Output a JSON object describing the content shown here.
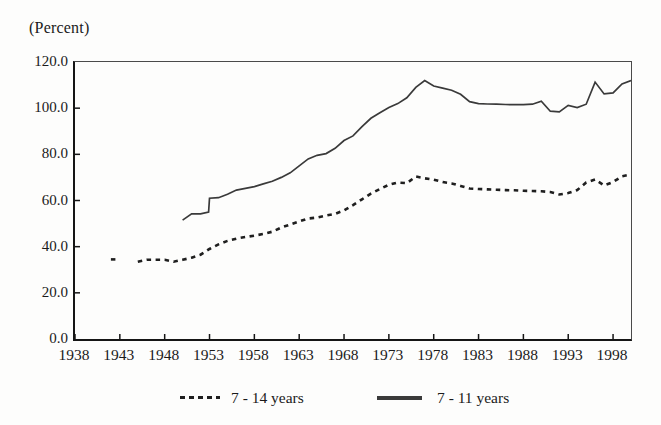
{
  "page": {
    "background": "#fdfdfc",
    "text_color": "#1a1a1a",
    "axis_color": "#151515"
  },
  "unit_label": "(Percent)",
  "chart_data": {
    "type": "line",
    "title": "",
    "xlabel": "",
    "ylabel": "(Percent)",
    "xlim": [
      1938,
      2000
    ],
    "ylim": [
      0,
      120
    ],
    "grid": false,
    "legend_position": "bottom-center",
    "x_ticks": [
      1938,
      1943,
      1948,
      1953,
      1958,
      1963,
      1968,
      1973,
      1978,
      1983,
      1988,
      1993,
      1998
    ],
    "y_ticks": [
      0,
      20,
      40,
      60,
      80,
      100,
      120
    ],
    "y_tick_labels": [
      "0.0",
      "20.0",
      "40.0",
      "60.0",
      "80.0",
      "100.0",
      "120.0"
    ],
    "series": [
      {
        "name": "7 - 14 years",
        "style": "dashed",
        "color": "#1f1f1f",
        "stroke_width": 2.6,
        "dash_pattern": "4.5 4.5",
        "segments": [
          [
            [
              1942,
              34.5
            ],
            [
              1942.7,
              34.5
            ]
          ],
          [
            [
              1945,
              33.5
            ],
            [
              1946,
              34.3
            ],
            [
              1947,
              34.3
            ],
            [
              1948,
              34.3
            ],
            [
              1949,
              33.5
            ],
            [
              1950,
              34.3
            ],
            [
              1951,
              35.2
            ],
            [
              1952,
              36.5
            ],
            [
              1953,
              39.0
            ],
            [
              1954,
              41.0
            ],
            [
              1955,
              42.5
            ],
            [
              1956,
              43.5
            ],
            [
              1957,
              44.2
            ],
            [
              1958,
              44.8
            ],
            [
              1959,
              45.5
            ],
            [
              1960,
              46.5
            ],
            [
              1961,
              48.3
            ],
            [
              1962,
              49.6
            ],
            [
              1963,
              51.0
            ],
            [
              1964,
              52.2
            ],
            [
              1965,
              52.6
            ],
            [
              1966,
              53.5
            ],
            [
              1967,
              54.2
            ],
            [
              1968,
              55.7
            ],
            [
              1969,
              58.0
            ],
            [
              1970,
              60.5
            ],
            [
              1971,
              63.0
            ],
            [
              1972,
              65.0
            ],
            [
              1973,
              66.8
            ],
            [
              1974,
              67.8
            ],
            [
              1975,
              67.5
            ],
            [
              1976,
              70.4
            ],
            [
              1977,
              69.6
            ],
            [
              1978,
              69.0
            ],
            [
              1979,
              68.0
            ],
            [
              1980,
              67.4
            ],
            [
              1981,
              66.3
            ],
            [
              1982,
              65.2
            ],
            [
              1983,
              65.0
            ],
            [
              1984,
              64.8
            ],
            [
              1985,
              64.7
            ],
            [
              1986,
              64.5
            ],
            [
              1987,
              64.4
            ],
            [
              1988,
              64.2
            ],
            [
              1989,
              64.1
            ],
            [
              1990,
              64.0
            ],
            [
              1991,
              63.7
            ],
            [
              1992,
              62.6
            ],
            [
              1993,
              63.2
            ],
            [
              1994,
              64.5
            ],
            [
              1995,
              67.8
            ],
            [
              1996,
              69.1
            ],
            [
              1997,
              66.5
            ],
            [
              1998,
              68.0
            ],
            [
              1999,
              70.5
            ],
            [
              2000,
              71.3
            ]
          ]
        ]
      },
      {
        "name": "7 - 11 years",
        "style": "solid",
        "color": "#3a3a3a",
        "stroke_width": 1.7,
        "dash_pattern": "",
        "segments": [
          [
            [
              1950,
              51.5
            ],
            [
              1951,
              54.2
            ],
            [
              1952,
              54.2
            ],
            [
              1952.9,
              55.0
            ],
            [
              1953,
              61.0
            ],
            [
              1954,
              61.2
            ],
            [
              1955,
              62.7
            ],
            [
              1956,
              64.5
            ],
            [
              1957,
              65.3
            ],
            [
              1958,
              66.0
            ],
            [
              1959,
              67.2
            ],
            [
              1960,
              68.3
            ],
            [
              1961,
              70.0
            ],
            [
              1962,
              72.0
            ],
            [
              1963,
              75.0
            ],
            [
              1964,
              78.0
            ],
            [
              1965,
              79.6
            ],
            [
              1966,
              80.3
            ],
            [
              1967,
              82.6
            ],
            [
              1968,
              86.0
            ],
            [
              1969,
              88.0
            ],
            [
              1970,
              92.0
            ],
            [
              1971,
              95.6
            ],
            [
              1972,
              98.0
            ],
            [
              1973,
              100.3
            ],
            [
              1974,
              102.0
            ],
            [
              1975,
              104.5
            ],
            [
              1976,
              109.0
            ],
            [
              1977,
              112.0
            ],
            [
              1978,
              109.6
            ],
            [
              1979,
              108.7
            ],
            [
              1980,
              107.8
            ],
            [
              1981,
              106.0
            ],
            [
              1982,
              102.8
            ],
            [
              1983,
              102.0
            ],
            [
              1984,
              101.8
            ],
            [
              1985,
              101.7
            ],
            [
              1986,
              101.6
            ],
            [
              1987,
              101.5
            ],
            [
              1988,
              101.5
            ],
            [
              1989,
              101.7
            ],
            [
              1990,
              103.0
            ],
            [
              1991,
              98.7
            ],
            [
              1992,
              98.4
            ],
            [
              1993,
              101.2
            ],
            [
              1994,
              100.3
            ],
            [
              1995,
              101.7
            ],
            [
              1996,
              111.3
            ],
            [
              1997,
              106.2
            ],
            [
              1998,
              106.6
            ],
            [
              1999,
              110.5
            ],
            [
              2000,
              112.0
            ]
          ]
        ]
      }
    ]
  }
}
